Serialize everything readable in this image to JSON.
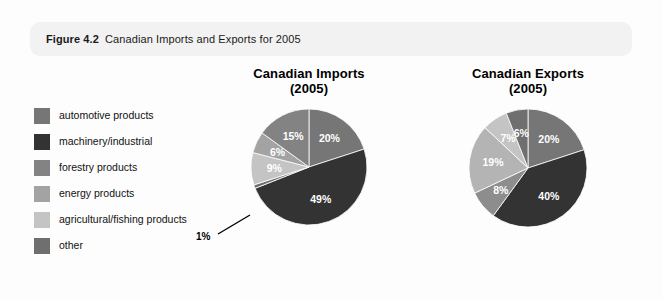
{
  "figure": {
    "number_label": "Figure 4.2",
    "caption": "Canadian Imports and Exports for 2005"
  },
  "legend": {
    "items": [
      {
        "label": "automotive products",
        "color": "#767676"
      },
      {
        "label": "machinery/industrial",
        "color": "#333333"
      },
      {
        "label": "forestry products",
        "color": "#838383"
      },
      {
        "label": "energy products",
        "color": "#a3a3a3"
      },
      {
        "label": "agricultural/fishing products",
        "color": "#c4c4c4"
      },
      {
        "label": "other",
        "color": "#6f6f6f"
      }
    ]
  },
  "callout": {
    "label": "1%"
  },
  "chart_data": [
    {
      "type": "pie",
      "title": "Canadian Imports",
      "subtitle": "(2005)",
      "categories": [
        "automotive products",
        "machinery/industrial",
        "other",
        "agricultural/fishing products",
        "energy products",
        "forestry products"
      ],
      "values": [
        20,
        49,
        1,
        9,
        6,
        15
      ],
      "labels": [
        "20%",
        "49%",
        "1%",
        "9%",
        "6%",
        "15%"
      ],
      "colors": [
        "#767676",
        "#333333",
        "#6f6f6f",
        "#c4c4c4",
        "#a3a3a3",
        "#838383"
      ],
      "label_placement": [
        "inside",
        "inside",
        "callout",
        "inside",
        "inside",
        "inside"
      ],
      "legend_position": "left",
      "grid": false
    },
    {
      "type": "pie",
      "title": "Canadian Exports",
      "subtitle": "(2005)",
      "categories": [
        "automotive products",
        "machinery/industrial",
        "other",
        "agricultural/fishing products",
        "energy products",
        "forestry products"
      ],
      "values": [
        20,
        40,
        8,
        19,
        7,
        6
      ],
      "labels": [
        "20%",
        "40%",
        "8%",
        "19%",
        "7%",
        "6%"
      ],
      "colors": [
        "#767676",
        "#333333",
        "#8d8d8d",
        "#b4b4b4",
        "#c4c4c4",
        "#6f6f6f"
      ],
      "label_placement": [
        "inside",
        "inside",
        "inside",
        "inside",
        "inside",
        "inside"
      ],
      "legend_position": "left",
      "grid": false
    }
  ]
}
